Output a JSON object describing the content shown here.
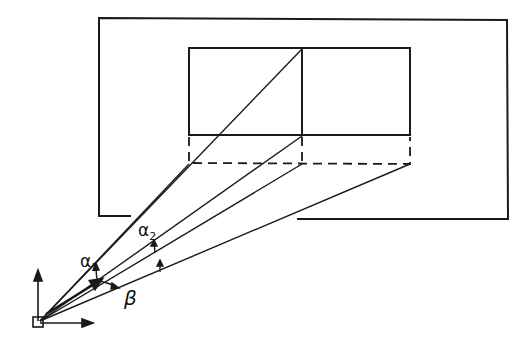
{
  "diagram": {
    "type": "geometric-projection",
    "colors": {
      "line": "#1a1a1a",
      "background": "#ffffff"
    },
    "labels": {
      "alpha1": {
        "symbol": "α",
        "subscript": "1"
      },
      "alpha2": {
        "symbol": "α",
        "subscript": "2"
      },
      "beta": {
        "symbol": "β"
      }
    },
    "elements": [
      "outer-frame",
      "inner-rectangle-left",
      "inner-rectangle-right",
      "dashed-projection-rectangle",
      "projection-rays",
      "coordinate-axes",
      "origin-square",
      "angle-arrows"
    ]
  }
}
